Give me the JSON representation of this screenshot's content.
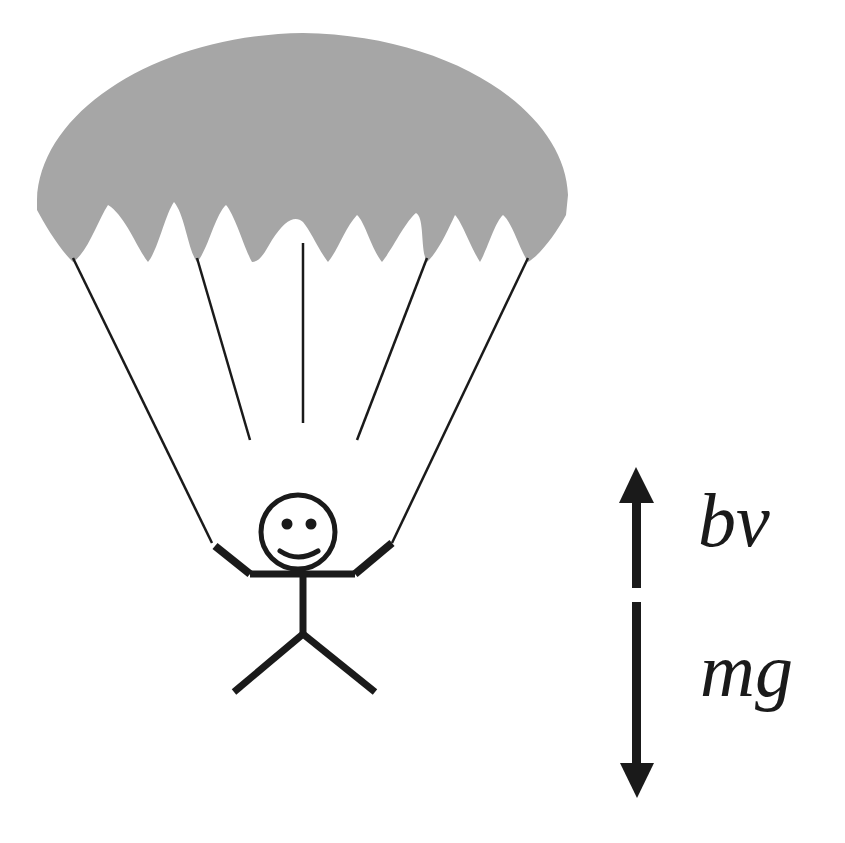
{
  "diagram": {
    "colors": {
      "canopy": "#a6a6a6",
      "ink": "#1a1a1a",
      "background": "#ffffff"
    },
    "forces": [
      {
        "label": "bv",
        "direction": "up"
      },
      {
        "label": "mg",
        "direction": "down"
      }
    ]
  }
}
